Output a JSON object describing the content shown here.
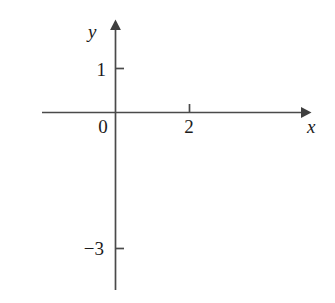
{
  "figure": {
    "background_color": "#ffffff",
    "ink_color": "#1b1b1b",
    "axis_color": "#4a4a4a",
    "width": 335,
    "height": 303
  },
  "axes": {
    "x_axis_label": "x",
    "y_axis_label": "y",
    "origin_label": "0",
    "x_arrow": "arrow-right",
    "y_arrow": "arrow-up"
  },
  "ticks": {
    "x": [
      {
        "value": 2,
        "label": "2"
      }
    ],
    "y": [
      {
        "value": 1,
        "label": "1"
      },
      {
        "value": -3,
        "label": "−3"
      }
    ]
  },
  "chart_data": {
    "type": "line",
    "title": "",
    "subtitle": "",
    "xlabel": "x",
    "ylabel": "y",
    "legend": [],
    "grid": false,
    "xlim": [
      -0.35,
      5.15
    ],
    "ylim": [
      -4.1,
      2.0
    ],
    "xticks": [
      2
    ],
    "xticklabels": [
      "2"
    ],
    "yticks": [
      1,
      -3
    ],
    "yticklabels": [
      "1",
      "−3"
    ],
    "annotations": [],
    "series": [
      {
        "name": "parabola",
        "equation": "y = -(x - 2)^2 + 1",
        "vertex": [
          2,
          1
        ],
        "y_intercept": [
          0,
          -3
        ],
        "x_intercepts": [
          1,
          3
        ],
        "opens": "down",
        "x_domain": [
          -0.3,
          4.55
        ],
        "color": "#1b1b1b",
        "linewidth": 3,
        "x": [
          -0.3,
          -0.06,
          0.18,
          0.42,
          0.66,
          0.9,
          1.14,
          1.39,
          1.63,
          1.87,
          2.11,
          2.35,
          2.59,
          2.83,
          3.07,
          3.31,
          3.55,
          3.79,
          4.03,
          4.28,
          4.52
        ],
        "y": [
          -4.29,
          -3.24,
          -2.31,
          -1.5,
          -0.8,
          -0.21,
          0.26,
          0.63,
          0.86,
          0.98,
          0.99,
          0.88,
          0.65,
          0.31,
          -0.15,
          -0.72,
          -1.4,
          -2.2,
          -3.12,
          -4.18,
          -5.35
        ]
      }
    ]
  }
}
